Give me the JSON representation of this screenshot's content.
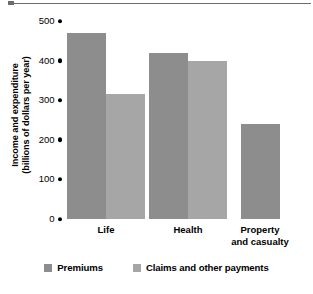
{
  "chart_data": {
    "type": "bar",
    "title": "",
    "xlabel": "",
    "ylabel": "Income and expenditure (billions of dollars per year)",
    "ylabel_lines": [
      "Income and expenditure",
      "(billions of dollars per year)"
    ],
    "categories": [
      "Life",
      "Health",
      "Property and casualty"
    ],
    "category_label_lines": [
      [
        "Life"
      ],
      [
        "Health"
      ],
      [
        "Property",
        "and casualty"
      ]
    ],
    "series": [
      {
        "name": "Premiums",
        "color": "#8d8d8d",
        "values": [
          470,
          420,
          240
        ]
      },
      {
        "name": "Claims and other payments",
        "color": "#a6a6a6",
        "values": [
          315,
          400,
          null
        ]
      }
    ],
    "ylim": [
      0,
      500
    ],
    "yticks": [
      500,
      400,
      300,
      200,
      100,
      0
    ],
    "ytick_labels": [
      "500",
      "400",
      "300",
      "200",
      "100",
      "0"
    ],
    "grid": false,
    "tick_marker": "round-dot",
    "legend_position": "bottom-center",
    "legend": [
      {
        "label": "Premiums",
        "color": "#8d8d8d"
      },
      {
        "label": "Claims and other payments",
        "color": "#a6a6a6"
      }
    ]
  }
}
